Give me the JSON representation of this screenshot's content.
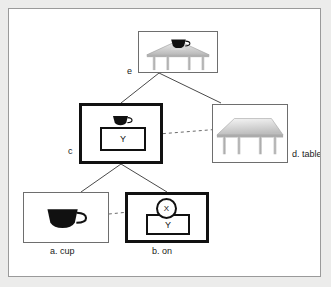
{
  "figure": {
    "type": "hierarchy-diagram",
    "background_color": "#ffffff",
    "frame_color": "#9a9a9a",
    "ink_color": "#111111"
  },
  "nodes": [
    {
      "id": "e",
      "label": "e",
      "label_position": "left",
      "border": "thin",
      "content": "table-with-cup-photo",
      "icon": "table-with-cup-icon"
    },
    {
      "id": "c",
      "label": "c",
      "label_position": "left",
      "border": "thick",
      "content": "cup-on-box-schematic",
      "icon": "cup-icon",
      "inner_box_label": "Y"
    },
    {
      "id": "d",
      "label": "d. table",
      "label_position": "right",
      "border": "thin",
      "content": "table-photo",
      "icon": "table-icon"
    },
    {
      "id": "a",
      "label": "a. cup",
      "label_position": "below",
      "border": "thin",
      "content": "cup-photo",
      "icon": "cup-icon"
    },
    {
      "id": "b",
      "label": "b. on",
      "label_position": "below",
      "border": "thick",
      "content": "x-on-y-schematic",
      "circle_label": "X",
      "inner_box_label": "Y"
    }
  ],
  "edges": {
    "solid": [
      {
        "from": "e",
        "to": "c"
      },
      {
        "from": "e",
        "to": "d"
      },
      {
        "from": "c",
        "to": "a"
      },
      {
        "from": "c",
        "to": "b"
      }
    ],
    "dashed": [
      {
        "from": "c",
        "to": "d"
      },
      {
        "from": "a",
        "to": "b"
      }
    ]
  },
  "labels": {
    "e": "e",
    "c": "c",
    "d": "d. table",
    "a": "a. cup",
    "b": "b. on",
    "x": "X",
    "y_c": "Y",
    "y_b": "Y"
  }
}
